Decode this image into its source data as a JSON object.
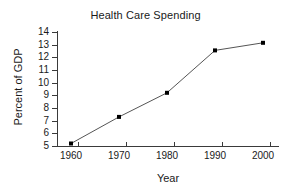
{
  "chart_data": {
    "type": "line",
    "title": "Health Care Spending",
    "xlabel": "Year",
    "ylabel": "Percent of GDP",
    "x": [
      1960,
      1970,
      1980,
      1990,
      2000
    ],
    "values": [
      5.2,
      7.3,
      9.2,
      12.55,
      13.15
    ],
    "xticklabels": [
      "1960",
      "1970",
      "1980",
      "1990",
      "2000"
    ],
    "yticklabels": [
      "14",
      "13",
      "12",
      "11",
      "10",
      "9",
      "8",
      "7",
      "6",
      "5"
    ],
    "yticks": [
      14,
      13,
      12,
      11,
      10,
      9,
      8,
      7,
      6,
      5
    ],
    "xlim": [
      1955,
      2005
    ],
    "ylim": [
      5,
      14
    ],
    "grid": false,
    "legend": null,
    "marker": "square",
    "line_color": "#555555",
    "marker_color": "#000000",
    "axis_color": "#3a3a3a",
    "text_color": "#1a1a1a",
    "background": "#ffffff"
  }
}
